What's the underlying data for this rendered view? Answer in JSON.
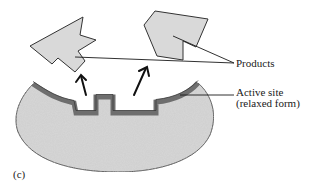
{
  "figure": {
    "panel_label": "(c)",
    "labels": {
      "products": "Products",
      "active_site_line1": "Active site",
      "active_site_line2": "(relaxed form)"
    },
    "colors": {
      "product_fill": "#d9d9d9",
      "enzyme_fill": "#cfcfcf",
      "active_site_lining": "#6e6e6e",
      "outline": "#333333",
      "leader_lines": "#1a1a1a",
      "arrows": "#111111"
    },
    "elements": [
      {
        "name": "product-left",
        "type": "polygon"
      },
      {
        "name": "product-right",
        "type": "polygon"
      },
      {
        "name": "release-arrow-left",
        "type": "arrow"
      },
      {
        "name": "release-arrow-right",
        "type": "arrow"
      },
      {
        "name": "enzyme-body",
        "type": "blob"
      },
      {
        "name": "active-site-relaxed",
        "type": "cavity"
      }
    ]
  }
}
